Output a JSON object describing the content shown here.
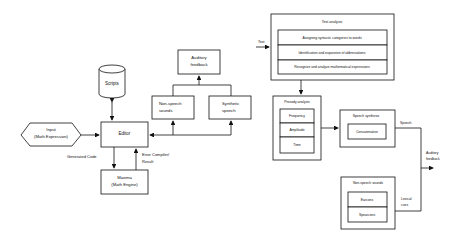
{
  "left_diagram": {
    "scripts": "Scripts",
    "input_line1": "Input",
    "input_line2": "(Math Expression)",
    "editor": "Editor",
    "maxima_line1": "Maxima",
    "maxima_line2": "(Math Engine)",
    "generated_code": "Generated Code",
    "error_line1": "Error Compiler/",
    "error_line2": "Result",
    "auditory_line1": "Auditory",
    "auditory_line2": "feedback",
    "nonspeech_line1": "Non-speech",
    "nonspeech_line2": "sounds",
    "synthetic_line1": "Synthetic",
    "synthetic_line2": "speech"
  },
  "right_diagram": {
    "text_label": "Text",
    "text_analysis": {
      "title": "Text analysis",
      "items": [
        "Assigning syntactic categories to words",
        "Identification and expansion of abbreviations",
        "Recognize and analyze mathematical expressions"
      ]
    },
    "prosody_analysis": {
      "title": "Prosody analysis",
      "items": [
        "Frequency",
        "Amplitude",
        "Time"
      ]
    },
    "speech_synthesis": {
      "title": "Speech synthesis",
      "items": [
        "Concatenative"
      ]
    },
    "non_speech_sounds": {
      "title": "Non-speech sounds",
      "items": [
        "Earcons",
        "Spearcons"
      ]
    },
    "speech_label": "Speech",
    "lexical_line1": "Lexical",
    "lexical_line2": "cues",
    "auditory_line1": "Auditory",
    "auditory_line2": "feedback"
  }
}
